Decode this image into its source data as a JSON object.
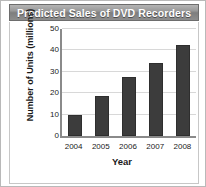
{
  "title": "Predicted Sales of DVD Recorders",
  "colors": {
    "bar": "#3c3c3c",
    "bar_border": "#2e2e2e",
    "gridline": "#d8d8d8",
    "axis": "#8a8a8a",
    "title_text": "#ffffff",
    "frame_border": "#b9b9b9",
    "background": "#ffffff"
  },
  "chart_data": {
    "type": "bar",
    "title": "Predicted Sales of DVD Recorders",
    "xlabel": "Year",
    "ylabel": "Number of Units (millions)",
    "categories": [
      "2004",
      "2005",
      "2006",
      "2007",
      "2008"
    ],
    "values": [
      10,
      18.5,
      27.5,
      34,
      42.5
    ],
    "ylim": [
      0,
      50
    ],
    "y_ticks": [
      0,
      10,
      20,
      30,
      40,
      50
    ],
    "y_tick_labels": [
      "0",
      "10",
      "20",
      "30",
      "40",
      "50"
    ],
    "grid": true,
    "legend": false,
    "legend_position": "none"
  }
}
